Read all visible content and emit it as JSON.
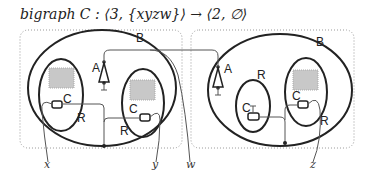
{
  "title": "bigraph C : ⟨3, {xyzw}⟩ → ⟨2, ∅⟩",
  "roots": [
    {
      "label": "B"
    },
    {
      "label": "B"
    }
  ],
  "nodes": {
    "A1": "A",
    "A2": "A",
    "R1": "R",
    "R2": "R",
    "R3": "R",
    "R4": "R",
    "C1": "C",
    "C2": "C",
    "C3": "C",
    "C4": "C"
  },
  "names": [
    "x",
    "y",
    "w",
    "z"
  ],
  "colors": {
    "stroke": "#222222",
    "site": "#c8c8c8",
    "link": "#555555",
    "region": "#999999"
  }
}
